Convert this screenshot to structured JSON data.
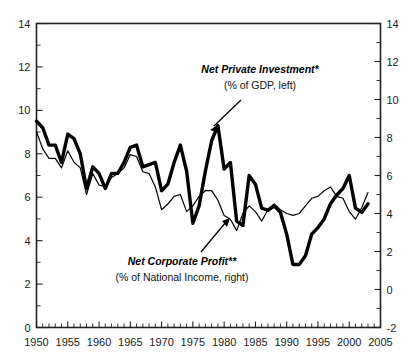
{
  "chart_data": {
    "type": "line",
    "title": "",
    "subtitle": "",
    "xlabel": "",
    "ylabel": "",
    "grid": false,
    "legend_position": "inline-annotations",
    "xlim": [
      1950,
      2005
    ],
    "x_tick_step_major": 5,
    "x_tick_step_minor": 1,
    "x_ticks": [
      "1950",
      "1955",
      "1960",
      "1965",
      "1970",
      "1975",
      "1980",
      "1985",
      "1990",
      "1995",
      "2000",
      "2005"
    ],
    "left_axis": {
      "label": "",
      "ylim": [
        0,
        14
      ],
      "ticks": [
        "0",
        "2",
        "4",
        "6",
        "8",
        "10",
        "12",
        "14"
      ],
      "tick_step": 2,
      "minor_tick_step": 1
    },
    "right_axis": {
      "label": "",
      "ylim": [
        -2,
        14
      ],
      "ticks": [
        "-2",
        "0",
        "2",
        "4",
        "6",
        "8",
        "10",
        "12",
        "14"
      ],
      "tick_step": 2,
      "minor_tick_step": 1
    },
    "annotations": [
      {
        "name": "net-private-investment",
        "title": "Net Private Investment*",
        "subtitle": "(% of GDP, left)",
        "points_to_year": 1978,
        "points_to_value": 9.3
      },
      {
        "name": "net-corporate-profit",
        "title": "Net Corporate Profit**",
        "subtitle": "(% of National Income, right)",
        "points_to_year": 1982,
        "points_to_value": 4.6
      }
    ],
    "series": [
      {
        "name": "Net Private Investment*",
        "axis": "left",
        "units": "% of GDP",
        "style": "thick",
        "x": [
          1950,
          1951,
          1952,
          1953,
          1954,
          1955,
          1956,
          1957,
          1958,
          1959,
          1960,
          1961,
          1962,
          1963,
          1964,
          1965,
          1966,
          1967,
          1968,
          1969,
          1970,
          1971,
          1972,
          1973,
          1974,
          1975,
          1976,
          1977,
          1978,
          1979,
          1980,
          1981,
          1982,
          1983,
          1984,
          1985,
          1986,
          1987,
          1988,
          1989,
          1990,
          1991,
          1992,
          1993,
          1994,
          1995,
          1996,
          1997,
          1998,
          1999,
          2000,
          2001,
          2002,
          2003
        ],
        "values": [
          9.5,
          9.2,
          8.4,
          8.4,
          7.6,
          8.9,
          8.7,
          8.0,
          6.4,
          7.4,
          7.1,
          6.4,
          7.1,
          7.1,
          7.6,
          8.3,
          8.4,
          7.4,
          7.5,
          7.6,
          6.3,
          6.6,
          7.6,
          8.4,
          7.2,
          4.8,
          5.6,
          7.2,
          8.6,
          9.3,
          7.3,
          7.6,
          4.9,
          4.7,
          7.0,
          6.6,
          5.5,
          5.4,
          5.6,
          5.3,
          4.3,
          2.9,
          2.9,
          3.3,
          4.3,
          4.6,
          5.0,
          5.7,
          6.1,
          6.4,
          7.0,
          5.5,
          5.3,
          5.7
        ],
        "peak_1979": 9.3,
        "trough_1992": 2.9
      },
      {
        "name": "Net Corporate Profit**",
        "axis": "right",
        "units": "% of National Income",
        "style": "thin",
        "x": [
          1950,
          1951,
          1952,
          1953,
          1954,
          1955,
          1956,
          1957,
          1958,
          1959,
          1960,
          1961,
          1962,
          1963,
          1964,
          1965,
          1966,
          1967,
          1968,
          1969,
          1970,
          1971,
          1972,
          1973,
          1974,
          1975,
          1976,
          1977,
          1978,
          1979,
          1980,
          1981,
          1982,
          1983,
          1984,
          1985,
          1986,
          1987,
          1988,
          1989,
          1990,
          1991,
          1992,
          1993,
          1994,
          1995,
          1996,
          1997,
          1998,
          1999,
          2000,
          2001,
          2002,
          2003
        ],
        "values": [
          8.3,
          7.4,
          6.9,
          6.9,
          6.4,
          7.3,
          6.7,
          6.4,
          5.0,
          6.1,
          5.5,
          5.4,
          5.9,
          6.1,
          6.4,
          7.1,
          7.0,
          6.2,
          6.1,
          5.4,
          4.2,
          4.5,
          4.9,
          5.0,
          4.1,
          4.4,
          4.9,
          5.2,
          5.2,
          4.7,
          3.9,
          3.7,
          3.1,
          4.0,
          4.4,
          4.1,
          3.6,
          4.2,
          4.5,
          4.2,
          4.0,
          3.9,
          4.0,
          4.4,
          4.8,
          4.9,
          5.2,
          5.4,
          4.9,
          4.8,
          4.1,
          3.7,
          4.3,
          5.1
        ]
      }
    ]
  },
  "colors": {
    "ink": "#000000",
    "axis": "#231f20",
    "background": "#ffffff"
  }
}
